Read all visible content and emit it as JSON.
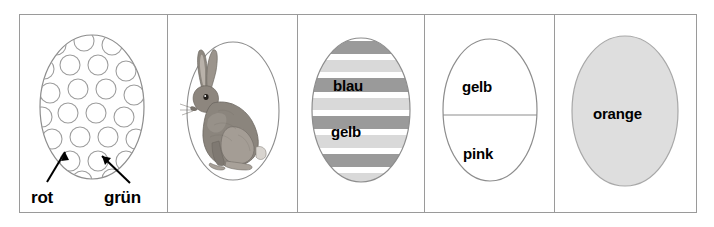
{
  "worksheet": {
    "title": "Ostereier Farben Arbeitsblatt",
    "cells": [
      {
        "id": "cell-dots",
        "egg_style": "dotted-outline",
        "fill": "#ffffff",
        "outline": "#8d8d8d",
        "labels": [
          {
            "text": "rot",
            "target": "egg-body"
          },
          {
            "text": "grün",
            "target": "dot"
          }
        ]
      },
      {
        "id": "cell-rabbit",
        "egg_style": "outline-with-rabbit",
        "fill": "#ffffff",
        "outline": "#8d8d8d",
        "figure": "sitting-hare",
        "labels": []
      },
      {
        "id": "cell-striped",
        "egg_style": "striped",
        "outline": "#8d8d8d",
        "stripe_dark": "#9a9a9a",
        "stripe_light": "#d9d9d9",
        "stripe_white": "#ffffff",
        "labels": [
          {
            "text": "blau",
            "band": "dark"
          },
          {
            "text": "gelb",
            "band": "light"
          }
        ]
      },
      {
        "id": "cell-halves",
        "egg_style": "split-horizontal",
        "fill": "#ffffff",
        "outline": "#8d8d8d",
        "labels": [
          {
            "text": "gelb",
            "half": "top"
          },
          {
            "text": "pink",
            "half": "bottom"
          }
        ]
      },
      {
        "id": "cell-solid",
        "egg_style": "solid-fill",
        "fill": "#dedede",
        "outline": "#9a9a9a",
        "labels": [
          {
            "text": "orange",
            "half": "center"
          }
        ]
      }
    ]
  },
  "colors": {
    "frame_border": "#9a9a9a",
    "text": "#000000",
    "page_background": "#ffffff"
  }
}
